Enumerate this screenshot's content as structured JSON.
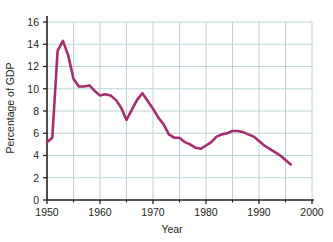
{
  "chart_data": {
    "type": "line",
    "title": "",
    "xlabel": "Year",
    "ylabel": "Percentage of GDP",
    "xlim": [
      1950,
      2000
    ],
    "ylim": [
      0,
      16
    ],
    "xticks": [
      1950,
      1960,
      1970,
      1980,
      1990,
      2000
    ],
    "xtick_labels": [
      "1950",
      "1960",
      "1970",
      "1980",
      "1990",
      "2000"
    ],
    "yticks": [
      0,
      2,
      4,
      6,
      8,
      10,
      12,
      14,
      16
    ],
    "ytick_labels": [
      "0",
      "2",
      "4",
      "6",
      "8",
      "10",
      "12",
      "14",
      "16"
    ],
    "x_minor_tick_interval": 5,
    "grid": true,
    "grid_color": "#b9d4d8",
    "legend": null,
    "line_color": "#a82d6e",
    "line_width": 2.6,
    "axis_color": "#231f20",
    "series": [
      {
        "name": "Percentage of GDP",
        "x": [
          1950,
          1951,
          1952,
          1953,
          1954,
          1955,
          1956,
          1957,
          1958,
          1959,
          1960,
          1961,
          1962,
          1963,
          1964,
          1965,
          1966,
          1967,
          1968,
          1969,
          1970,
          1971,
          1972,
          1973,
          1974,
          1975,
          1976,
          1977,
          1978,
          1979,
          1980,
          1981,
          1982,
          1983,
          1984,
          1985,
          1986,
          1987,
          1988,
          1989,
          1990,
          1991,
          1992,
          1993,
          1994,
          1995,
          1996
        ],
        "values": [
          5.2,
          5.6,
          13.4,
          14.3,
          13.0,
          10.9,
          10.2,
          10.2,
          10.3,
          9.8,
          9.4,
          9.5,
          9.4,
          9.0,
          8.3,
          7.2,
          8.1,
          9.0,
          9.6,
          8.9,
          8.2,
          7.4,
          6.8,
          5.9,
          5.6,
          5.6,
          5.2,
          5.0,
          4.7,
          4.6,
          4.9,
          5.2,
          5.7,
          5.9,
          6.0,
          6.2,
          6.2,
          6.1,
          5.9,
          5.7,
          5.3,
          4.9,
          4.6,
          4.3,
          4.0,
          3.6,
          3.2
        ]
      }
    ]
  },
  "axes": {
    "x_title": "Year",
    "y_title": "Percentage of GDP"
  }
}
